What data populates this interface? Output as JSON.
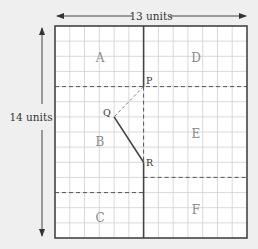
{
  "diagram": {
    "width_label": "13 units",
    "height_label": "14 units",
    "grid": {
      "cols": 13,
      "rows": 14
    },
    "regions": [
      {
        "id": "A",
        "label": "A"
      },
      {
        "id": "B",
        "label": "B"
      },
      {
        "id": "C",
        "label": "C"
      },
      {
        "id": "D",
        "label": "D"
      },
      {
        "id": "E",
        "label": "E"
      },
      {
        "id": "F",
        "label": "F"
      }
    ],
    "points": [
      {
        "name": "P",
        "label": "P",
        "col": 6,
        "row": 4
      },
      {
        "name": "Q",
        "label": "Q",
        "col": 4,
        "row": 6
      },
      {
        "name": "R",
        "label": "R",
        "col": 6,
        "row": 9
      }
    ],
    "colors": {
      "background": "#efefef",
      "grid_fill": "#ffffff",
      "grid_line": "#c9c9c9",
      "border": "#444444",
      "label": "#8a8a8a"
    }
  }
}
